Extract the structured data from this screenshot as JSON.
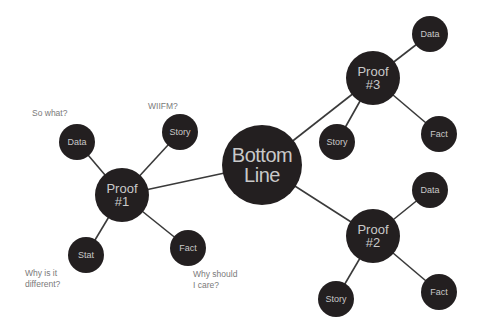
{
  "colors": {
    "node_fill": "#231f20",
    "node_text": "#c9c9c9",
    "edge": "#3a3a3a",
    "annotation_text": "#7a7a7a",
    "background": "#ffffff"
  },
  "center": {
    "label": "Bottom\nLine",
    "x": 262,
    "y": 165,
    "r": 40
  },
  "proofs": [
    {
      "id": "proof-1",
      "label": "Proof\n#1",
      "x": 122,
      "y": 195,
      "r": 27,
      "leaves": [
        {
          "label": "Data",
          "x": 77,
          "y": 142,
          "r": 18
        },
        {
          "label": "Story",
          "x": 180,
          "y": 132,
          "r": 18
        },
        {
          "label": "Stat",
          "x": 86,
          "y": 255,
          "r": 18
        },
        {
          "label": "Fact",
          "x": 188,
          "y": 248,
          "r": 18
        }
      ]
    },
    {
      "id": "proof-3",
      "label": "Proof\n#3",
      "x": 373,
      "y": 78,
      "r": 27,
      "leaves": [
        {
          "label": "Data",
          "x": 430,
          "y": 34,
          "r": 18
        },
        {
          "label": "Story",
          "x": 337,
          "y": 142,
          "r": 18
        },
        {
          "label": "Fact",
          "x": 439,
          "y": 134,
          "r": 18
        }
      ]
    },
    {
      "id": "proof-2",
      "label": "Proof\n#2",
      "x": 373,
      "y": 236,
      "r": 27,
      "leaves": [
        {
          "label": "Data",
          "x": 430,
          "y": 190,
          "r": 18
        },
        {
          "label": "Story",
          "x": 336,
          "y": 299,
          "r": 18
        },
        {
          "label": "Fact",
          "x": 439,
          "y": 292,
          "r": 18
        }
      ]
    }
  ],
  "annotations": [
    {
      "id": "so-what",
      "text": "So what?",
      "x": 32,
      "y": 108
    },
    {
      "id": "wiifm",
      "text": "WIIFM?",
      "x": 148,
      "y": 101
    },
    {
      "id": "why-different",
      "text": "Why is it\n  different?",
      "x": 25,
      "y": 268
    },
    {
      "id": "why-care",
      "text": "Why should\n   I care?",
      "x": 193,
      "y": 269
    }
  ]
}
